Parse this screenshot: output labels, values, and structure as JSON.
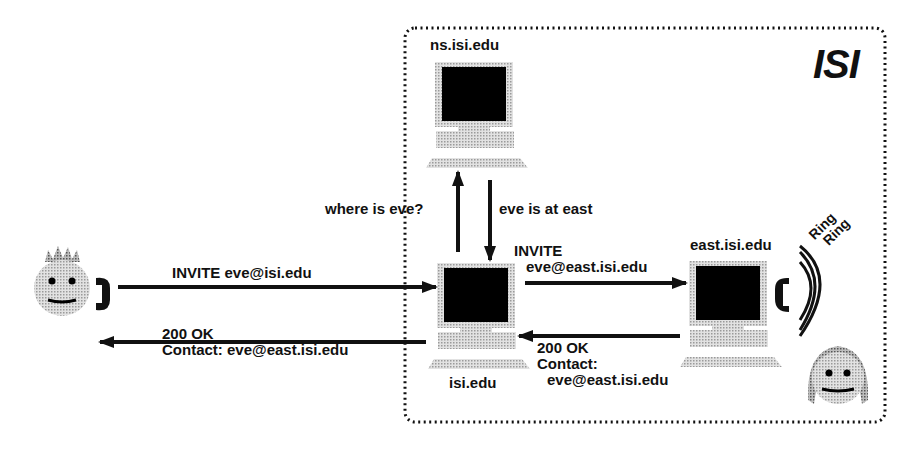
{
  "domain_box": {
    "title": "ISI"
  },
  "hosts": {
    "ns": {
      "name": "ns.isi.edu"
    },
    "proxy": {
      "name": "isi.edu"
    },
    "east": {
      "name": "east.isi.edu"
    }
  },
  "messages": {
    "invite_caller": "INVITE eve@isi.edu",
    "ok_caller_line1": "200 OK",
    "ok_caller_line2": "Contact: eve@east.isi.edu",
    "query": "where is eve?",
    "answer": "eve is at east",
    "invite_east_line1": "INVITE",
    "invite_east_line2": "eve@east.isi.edu",
    "ok_east_line1": "200 OK",
    "ok_east_line2": "Contact:",
    "ok_east_line3": "eve@east.isi.edu"
  },
  "ring": {
    "line1": "Ring",
    "line2": "Ring"
  },
  "colors": {
    "stroke": "#111111",
    "screen": "#000000",
    "shade": "#c8c8c8"
  }
}
